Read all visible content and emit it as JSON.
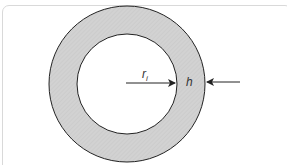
{
  "diagram": {
    "type": "annulus-cross-section",
    "colors": {
      "ring_fill": "#d0d0d0",
      "stroke": "#222222",
      "frame_border": "#d9d9d9"
    },
    "outer_circle": {
      "cx": 127,
      "cy": 84,
      "r": 78
    },
    "inner_circle": {
      "cx": 127,
      "cy": 84,
      "r": 50
    },
    "labels": {
      "inner_radius": "r",
      "inner_radius_subscript": "i",
      "thickness": "h"
    }
  }
}
